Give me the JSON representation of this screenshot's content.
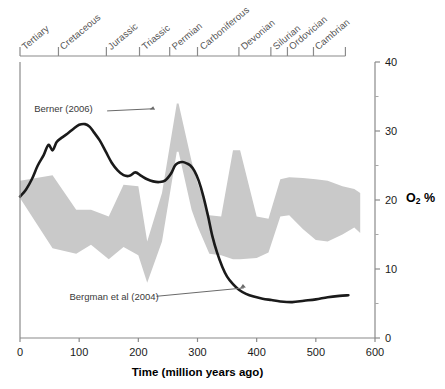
{
  "chart_data": {
    "type": "line",
    "title": "",
    "xlabel": "Time (million years ago)",
    "ylabel": "O2 %",
    "ylabel_html": "O<sub>2</sub> %",
    "xlim": [
      0,
      600
    ],
    "ylim": [
      0,
      40
    ],
    "grid": false,
    "legend_position": "inline-annotations",
    "x_ticks": [
      0,
      100,
      200,
      300,
      400,
      500,
      600
    ],
    "x_tick_labels": [
      "0",
      "100",
      "200",
      "300",
      "400",
      "500",
      "600"
    ],
    "y_ticks": [
      0,
      10,
      20,
      30,
      40
    ],
    "y_tick_labels": [
      "0",
      "10",
      "20",
      "30",
      "40"
    ],
    "y_minor_ticks": [
      5,
      15,
      25,
      35
    ],
    "y_axis_side": "right",
    "x_axis_direction": "left-to-right-increasing-age",
    "series": [
      {
        "name": "Bergman et al (2004)",
        "type": "line",
        "color": "#1a1a1a",
        "annotation_label": "Bergman et al (2004)",
        "x": [
          0,
          10,
          20,
          30,
          40,
          48,
          55,
          62,
          70,
          80,
          90,
          100,
          110,
          118,
          125,
          135,
          145,
          155,
          165,
          175,
          185,
          195,
          205,
          215,
          225,
          235,
          245,
          255,
          262,
          268,
          275,
          282,
          288,
          295,
          302,
          310,
          318,
          325,
          333,
          342,
          350,
          360,
          370,
          382,
          395,
          410,
          425,
          440,
          460,
          480,
          500,
          520,
          540,
          555
        ],
        "y": [
          20.5,
          21.5,
          23.0,
          25.0,
          26.5,
          28.0,
          27.2,
          28.4,
          29.0,
          29.6,
          30.3,
          30.9,
          31.0,
          30.6,
          29.8,
          28.6,
          27.0,
          25.4,
          24.3,
          23.6,
          23.5,
          24.0,
          23.5,
          23.0,
          22.7,
          22.6,
          22.8,
          23.8,
          25.0,
          25.4,
          25.5,
          25.3,
          25.0,
          24.2,
          22.8,
          20.5,
          17.6,
          14.8,
          12.4,
          10.3,
          8.9,
          7.8,
          7.0,
          6.4,
          6.0,
          5.7,
          5.5,
          5.3,
          5.2,
          5.4,
          5.6,
          5.9,
          6.1,
          6.2
        ]
      },
      {
        "name": "Berner (2006)",
        "type": "band",
        "color": "#c9c9c9",
        "annotation_label": "Berner (2006)",
        "x": [
          0,
          55,
          95,
          120,
          150,
          175,
          200,
          215,
          240,
          265,
          268,
          290,
          300,
          320,
          340,
          360,
          372,
          400,
          420,
          440,
          455,
          478,
          500,
          520,
          545,
          565,
          575
        ],
        "upper": [
          22.8,
          23.6,
          18.6,
          18.6,
          17.6,
          22.2,
          22.0,
          14.0,
          21.0,
          34.0,
          34.0,
          25.6,
          22.5,
          17.8,
          17.6,
          27.2,
          27.2,
          17.6,
          17.3,
          23.0,
          23.3,
          23.2,
          23.0,
          22.8,
          22.0,
          21.6,
          21.0
        ],
        "lower": [
          20.3,
          13.0,
          12.2,
          13.5,
          11.4,
          13.2,
          12.0,
          8.0,
          14.0,
          27.0,
          27.0,
          18.6,
          16.2,
          12.2,
          12.0,
          11.4,
          11.4,
          11.6,
          12.4,
          17.6,
          17.8,
          15.8,
          14.2,
          14.0,
          15.0,
          16.0,
          15.2
        ]
      }
    ],
    "geologic_periods": [
      {
        "label": "Tertiary",
        "start_ma": 0,
        "end_ma": 65
      },
      {
        "label": "Cretaceous",
        "start_ma": 65,
        "end_ma": 146
      },
      {
        "label": "Jurassic",
        "start_ma": 146,
        "end_ma": 202
      },
      {
        "label": "Triassic",
        "start_ma": 202,
        "end_ma": 253
      },
      {
        "label": "Permian",
        "start_ma": 253,
        "end_ma": 300
      },
      {
        "label": "Carboniferous",
        "start_ma": 300,
        "end_ma": 370
      },
      {
        "label": "Devonian",
        "start_ma": 370,
        "end_ma": 424
      },
      {
        "label": "Silurian",
        "start_ma": 424,
        "end_ma": 452
      },
      {
        "label": "Ordovician",
        "start_ma": 452,
        "end_ma": 496
      },
      {
        "label": "Cambrian",
        "start_ma": 496,
        "end_ma": 550
      }
    ],
    "annotations": [
      {
        "text": "Berner (2006)",
        "label_x_ma": 105,
        "label_y_pct": 33.2,
        "leader_to_x_ma": 230,
        "leader_to_y_pct": 33.0
      },
      {
        "text": "Bergman et al (2004)",
        "label_x_ma": 180,
        "label_y_pct": 5.9,
        "leader_to_x_ma": 375,
        "leader_to_y_pct": 7.4
      }
    ]
  },
  "colors": {
    "band_fill": "#c9c9c9",
    "curve": "#1a1a1a",
    "axis": "#6e6e6e",
    "period_text": "#555555",
    "tick_text": "#1a1a1a"
  }
}
